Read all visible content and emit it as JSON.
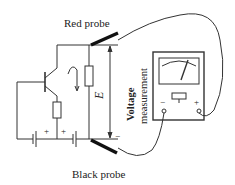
{
  "diagram": {
    "labels": {
      "red_probe": "Red probe",
      "black_probe": "Black probe",
      "voltage_line1": "Voltage",
      "voltage_line2": "measurement",
      "emf": "E",
      "plus": "+",
      "minus": "−"
    },
    "colors": {
      "line": "#333333",
      "probe": "#111111",
      "text": "#222222"
    }
  }
}
